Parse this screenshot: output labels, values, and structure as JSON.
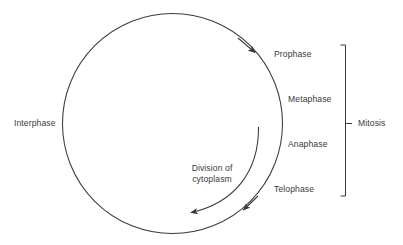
{
  "diagram": {
    "type": "cycle-diagram",
    "background_color": "#ffffff",
    "stroke_color": "#3a3a3a",
    "text_color": "#3a3a3a",
    "labels": {
      "interphase": "Interphase",
      "prophase": "Prophase",
      "metaphase": "Metaphase",
      "anaphase": "Anaphase",
      "telophase": "Telophase",
      "mitosis": "Mitosis",
      "division_line1": "Division of",
      "division_line2": "cytoplasm"
    },
    "geometry": {
      "circle": {
        "cx": 172.5,
        "cy": 123.5,
        "r": 110
      },
      "bracket": {
        "x": 345,
        "y_top": 45,
        "y_bottom": 196,
        "tick_y": 123.5
      },
      "arrow_prophase": {
        "x": 255,
        "y": 52
      },
      "arrow_cycle_end": {
        "x": 243,
        "y": 210
      },
      "inner_arc": {
        "start_x": 258,
        "start_y": 127,
        "end_x": 190,
        "end_y": 212
      }
    }
  }
}
